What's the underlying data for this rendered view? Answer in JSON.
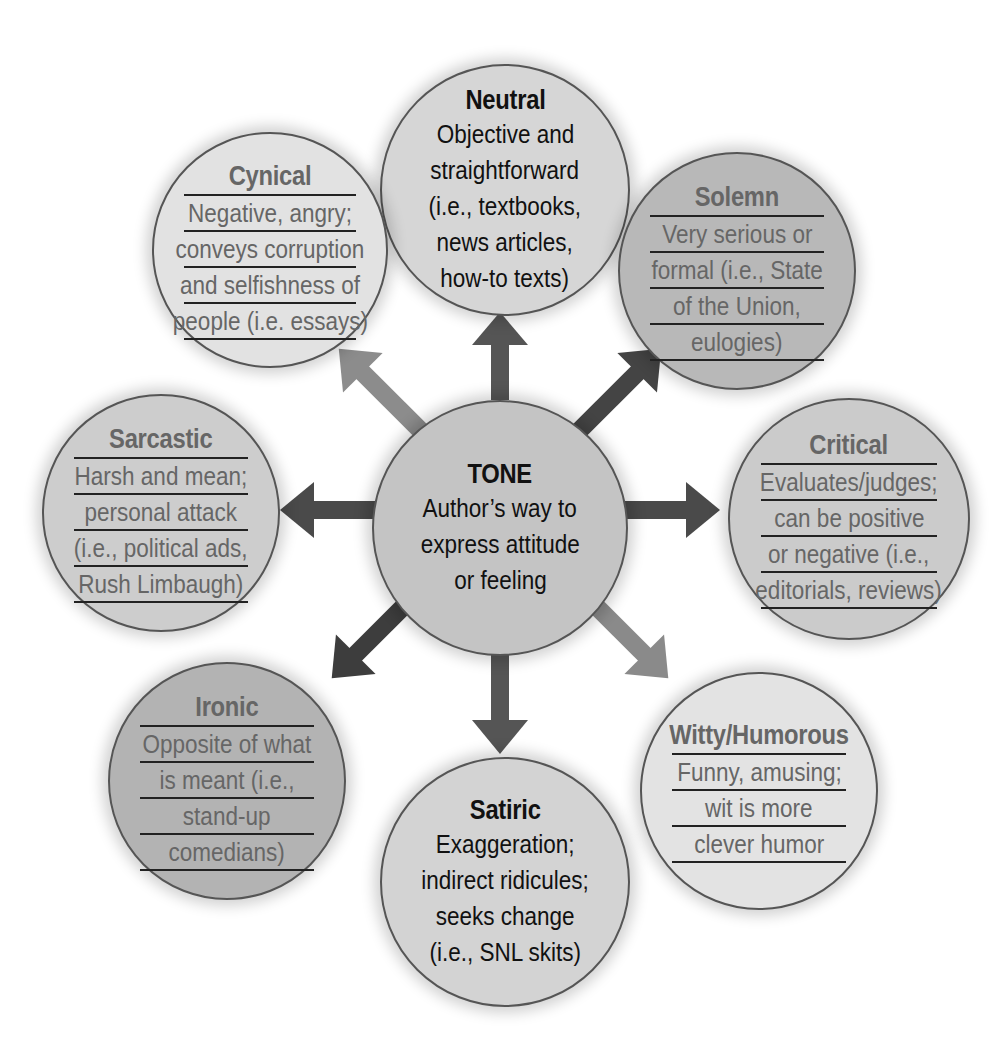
{
  "center": {
    "title": "TONE",
    "lines": [
      "Author’s way to",
      "express attitude",
      "or feeling"
    ],
    "fill": "#c4c4c4"
  },
  "nodes": [
    {
      "id": "neutral",
      "title": "Neutral",
      "lines": [
        "Objective and",
        "straightforward",
        "(i.e., textbooks,",
        "news articles,",
        "how-to texts)"
      ],
      "fill": "#d6d6d6",
      "style": "dark"
    },
    {
      "id": "solemn",
      "title": "Solemn",
      "lines": [
        "Very serious or",
        "formal (i.e., State",
        "of the Union,",
        "eulogies)"
      ],
      "fill": "#b8b8b8",
      "style": "ruled"
    },
    {
      "id": "critical",
      "title": "Critical",
      "lines": [
        "Evaluates/judges;",
        "can be positive",
        "or negative (i.e.,",
        "editorials, reviews)"
      ],
      "fill": "#cbcbcb",
      "style": "ruled"
    },
    {
      "id": "witty",
      "title": "Witty/Humorous",
      "lines": [
        "Funny, amusing;",
        "wit is more",
        "clever humor"
      ],
      "fill": "#e3e3e3",
      "style": "ruled"
    },
    {
      "id": "satiric",
      "title": "Satiric",
      "lines": [
        "Exaggeration;",
        "indirect ridicules;",
        "seeks change",
        "(i.e., SNL skits)"
      ],
      "fill": "#d3d3d3",
      "style": "dark"
    },
    {
      "id": "ironic",
      "title": "Ironic",
      "lines": [
        "Opposite of what",
        "is meant (i.e.,",
        "stand-up",
        "comedians)"
      ],
      "fill": "#b3b3b3",
      "style": "ruled"
    },
    {
      "id": "sarcastic",
      "title": "Sarcastic",
      "lines": [
        "Harsh and mean;",
        "personal attack",
        "(i.e., political ads,",
        "Rush Limbaugh)"
      ],
      "fill": "#cdcdcd",
      "style": "ruled"
    },
    {
      "id": "cynical",
      "title": "Cynical",
      "lines": [
        "Negative, angry;",
        "conveys corruption",
        "and selfishness of",
        "people (i.e. essays)"
      ],
      "fill": "#e2e2e2",
      "style": "ruled"
    }
  ],
  "arrow_colors": {
    "neutral": "#555555",
    "solemn": "#444444",
    "critical": "#4a4a4a",
    "witty": "#8a8a8a",
    "satiric": "#555555",
    "ironic": "#3d3d3d",
    "sarcastic": "#4a4a4a",
    "cynical": "#8c8c8c"
  }
}
